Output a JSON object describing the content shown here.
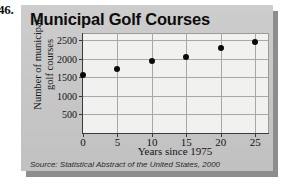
{
  "problem": {
    "number": "46."
  },
  "figure": {
    "title": "Municipal Golf Courses",
    "source": "Source: Statistical Abstract of the United States, 2000",
    "panel_color": "#c9c9c9",
    "plot_background": "#f1f1ef",
    "point_color": "#0b0b0b",
    "grid_color": "#a8a8a8",
    "axis_color": "#3b3b3b"
  },
  "chart_data": {
    "type": "scatter",
    "title": "Municipal Golf Courses",
    "xlabel": "Years since 1975",
    "ylabel": "Number of municipal golf courses",
    "x": [
      0,
      5,
      10,
      15,
      20,
      25
    ],
    "values": [
      1560,
      1730,
      1950,
      2040,
      2300,
      2450
    ],
    "points": [
      {
        "x": 0,
        "y": 1560
      },
      {
        "x": 5,
        "y": 1730
      },
      {
        "x": 10,
        "y": 1950
      },
      {
        "x": 15,
        "y": 2040
      },
      {
        "x": 20,
        "y": 2300
      },
      {
        "x": 25,
        "y": 2450
      }
    ],
    "xlim": [
      0,
      27
    ],
    "ylim": [
      0,
      2700
    ],
    "xticks": [
      0,
      5,
      10,
      15,
      20,
      25
    ],
    "xtick_labels": [
      "0",
      "5",
      "10",
      "15",
      "20",
      "25"
    ],
    "yticks": [
      500,
      1000,
      1500,
      2000,
      2500
    ],
    "ytick_labels": [
      "500",
      "1000",
      "1500",
      "2000",
      "2500"
    ],
    "grid": true,
    "legend": false,
    "source": "Source: Statistical Abstract of the United States, 2000"
  }
}
